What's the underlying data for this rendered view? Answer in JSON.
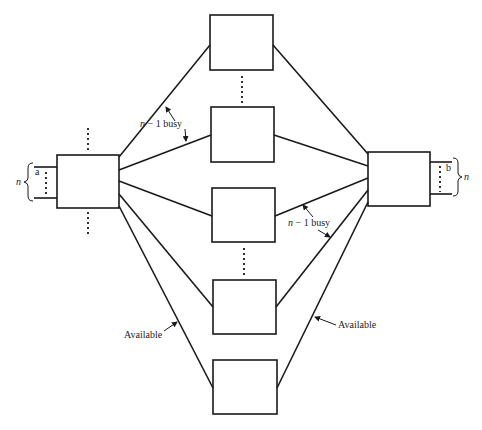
{
  "diagram": {
    "type": "three-stage switching network",
    "colors": {
      "line": "#1a1a1a",
      "background": "#ffffff",
      "text": "#222222"
    },
    "left_switch": {
      "input_label": "a",
      "count_label": "n"
    },
    "right_switch": {
      "output_label": "b",
      "count_label": "n"
    },
    "middle_switches": 5,
    "labels": {
      "busy_left": {
        "n": "n",
        "rest": " − 1 busy"
      },
      "busy_right": {
        "n": "n",
        "rest": " − 1 busy"
      },
      "available_left": "Available",
      "available_right": "Available"
    }
  }
}
